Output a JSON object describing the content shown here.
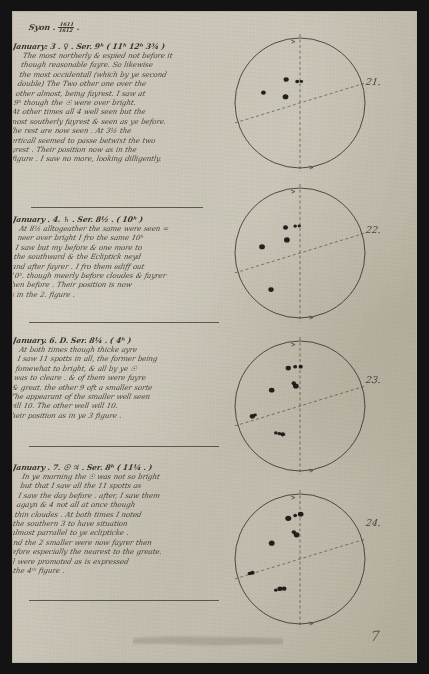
{
  "document": {
    "title_line": "Syon .",
    "year_numerator": "1611",
    "year_denominator": "1612",
    "page_number": "7",
    "paper_color": "#d8d4c9",
    "ink_color": "#26211b",
    "frame_color": "#131313"
  },
  "entries": [
    {
      "id": "entry-jan-3",
      "heading": "January: 3 . ♀ . Ser. 9ʰ ( 11ʰ 12ʰ 3¾ )",
      "heading_plain": "January: 3. Ser. 9 (11 12 3 3/4)",
      "lines": [
        "The most northerly & espied not before it",
        "though reasonable fayre. So likewise",
        "the most occidentall (which by ye second",
        "double) The Two other one over the",
        "other almost, being fayrest. I saw at",
        "9ʰ though the ☉ were over bright.",
        "At other times all 4 well seen but the",
        "most southerly fayrest & seen as ye before.",
        "The rest are now seen . At 3½ the",
        "Verticall seemed to passe betwixt the two",
        "fayrest . Their position now as in the",
        "1. figure . I saw no more, looking dilligently."
      ],
      "figure": {
        "label": "21.",
        "spots": [
          {
            "cx": 0.4,
            "cy": 0.33,
            "r": 2.6
          },
          {
            "cx": 0.48,
            "cy": 0.345,
            "r": 2.0
          },
          {
            "cx": 0.51,
            "cy": 0.345,
            "r": 1.7
          },
          {
            "cx": 0.235,
            "cy": 0.425,
            "r": 2.4
          },
          {
            "cx": 0.395,
            "cy": 0.455,
            "r": 2.9
          }
        ]
      }
    },
    {
      "id": "entry-jan-4",
      "heading": "January . 4. ♄ . Ser. 8½ . ( 10ʰ )",
      "heading_plain": "January. 4. Ser. 8 1/2 (10)",
      "lines": [
        "At 8½ alltogeather the same were seen =",
        "neer over bright I fro the same 10ʰ",
        "I saw but my before & one more to",
        "the southward & the Ecliptick neyd",
        "and after fayrer . I fro them ediff out",
        "10ʰ. though meerly before cloudes & fayrer",
        "then before . Their position is now",
        "as in the 2. figure ."
      ],
      "figure": {
        "label": "22.",
        "spots": [
          {
            "cx": 0.395,
            "cy": 0.315,
            "r": 2.5
          },
          {
            "cx": 0.465,
            "cy": 0.305,
            "r": 1.8
          },
          {
            "cx": 0.495,
            "cy": 0.305,
            "r": 1.7
          },
          {
            "cx": 0.405,
            "cy": 0.405,
            "r": 2.9
          },
          {
            "cx": 0.225,
            "cy": 0.455,
            "r": 2.9
          },
          {
            "cx": 0.29,
            "cy": 0.765,
            "r": 2.7
          }
        ]
      }
    },
    {
      "id": "entry-jan-6",
      "heading": "January. 6. D. Ser. 8¼ . ( 4ʰ )",
      "heading_plain": "January. 6. D. Ser. 8 1/4 (4)",
      "lines": [
        "At both times though thicke ayre",
        "I saw 11 spotts in all, the former being",
        "fomewhat to bright, & all by ye ☉",
        "was to cleare . & of them were fayre",
        "& great. the other 9 oft a smaller sorte",
        "The appearant of the smaller well seen",
        "will 10. The other well will 10.",
        "Their position as in ye 3 figure ."
      ],
      "figure": {
        "label": "23.",
        "spots": [
          {
            "cx": 0.415,
            "cy": 0.225,
            "r": 2.7
          },
          {
            "cx": 0.465,
            "cy": 0.215,
            "r": 2.0
          },
          {
            "cx": 0.505,
            "cy": 0.215,
            "r": 2.1
          },
          {
            "cx": 0.455,
            "cy": 0.335,
            "r": 2.2
          },
          {
            "cx": 0.47,
            "cy": 0.355,
            "r": 2.9
          },
          {
            "cx": 0.295,
            "cy": 0.385,
            "r": 2.8
          },
          {
            "cx": 0.155,
            "cy": 0.575,
            "r": 2.6
          },
          {
            "cx": 0.175,
            "cy": 0.565,
            "r": 1.7
          },
          {
            "cx": 0.325,
            "cy": 0.695,
            "r": 1.8
          },
          {
            "cx": 0.35,
            "cy": 0.7,
            "r": 1.9
          },
          {
            "cx": 0.375,
            "cy": 0.705,
            "r": 2.4
          }
        ]
      }
    },
    {
      "id": "entry-jan-7",
      "heading": "January . 7. ☉ ♃ . Ser. 8ʰ ( 11¼ . )",
      "heading_plain": "January. 7. Ser. 8 (11 1/4)",
      "lines": [
        "In ye morning the ☉ was not so bright",
        "but that I saw all the 11 spotts as",
        "I saw the day before . after, I saw them",
        "agayn & 4 not all at once though",
        "thin cloudes . At both times I noted",
        "the southern 3 to have situation",
        "almost parrallel to ye eclipticke .",
        "and the 2 smaller were now fayrer then",
        "before especially the nearest to the greate.",
        "All were promoted as is expressed",
        "in the 4ᵗʰ figure ."
      ],
      "figure": {
        "label": "24.",
        "spots": [
          {
            "cx": 0.415,
            "cy": 0.205,
            "r": 3.0
          },
          {
            "cx": 0.465,
            "cy": 0.185,
            "r": 1.9
          },
          {
            "cx": 0.505,
            "cy": 0.175,
            "r": 2.8
          },
          {
            "cx": 0.455,
            "cy": 0.305,
            "r": 2.2
          },
          {
            "cx": 0.475,
            "cy": 0.325,
            "r": 2.9
          },
          {
            "cx": 0.295,
            "cy": 0.385,
            "r": 2.9
          },
          {
            "cx": 0.135,
            "cy": 0.605,
            "r": 2.0
          },
          {
            "cx": 0.155,
            "cy": 0.6,
            "r": 2.3
          },
          {
            "cx": 0.325,
            "cy": 0.725,
            "r": 1.9
          },
          {
            "cx": 0.355,
            "cy": 0.715,
            "r": 2.6
          },
          {
            "cx": 0.385,
            "cy": 0.715,
            "r": 2.4
          }
        ]
      }
    }
  ],
  "figure_geometry": {
    "meridian_label": "vertical-dashed-meridian",
    "ecliptic_label": "diagonal-dashed-ecliptic",
    "ecliptic_tilt_degrees": -17
  }
}
